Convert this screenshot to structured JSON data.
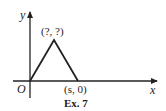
{
  "figure": {
    "caption": "Ex. 7",
    "axes": {
      "x_label": "x",
      "y_label": "y",
      "origin_label": "O"
    },
    "points": {
      "apex_label": "(?, ?)",
      "base_end_label": "(s, 0)"
    },
    "colors": {
      "line": "#222222",
      "background": "#ffffff"
    }
  }
}
